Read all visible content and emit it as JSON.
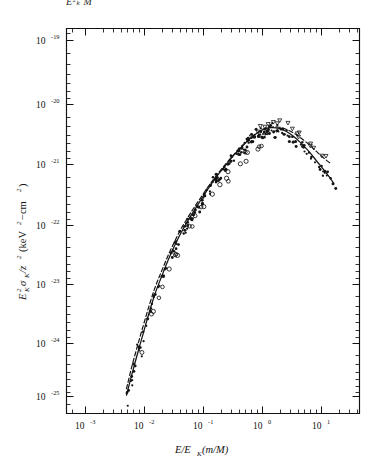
{
  "figure": {
    "clipped_top_text": "E²ₖ M",
    "background_color": "#ffffff",
    "ink_color": "#141414"
  },
  "chart_data": {
    "type": "scatter",
    "title": "",
    "subtitle": "",
    "xlabel": "E/E_K (m/M)",
    "ylabel": "E_K² σ_K/z² (keV² − cm²)",
    "xlabel_parts": {
      "main1": "E/E",
      "sub1": "K",
      "paren": " (m/M)"
    },
    "ylabel_parts": {
      "e": "E",
      "e_sup": "2",
      "e_sub": "K",
      "sigma": "σ",
      "sigma_sub": "K",
      "slash_z": "/z",
      "z_sup": "2",
      "unit": "(keV",
      "unit_sup": "2",
      "unit_tail": "−cm",
      "unit_tail_sup": "2",
      "unit_close": ")"
    },
    "xscale": "log",
    "yscale": "log",
    "xlim": [
      0.0004365,
      31.62
    ],
    "ylim": [
      6.3e-26,
      2e-19
    ],
    "grid": false,
    "legend": "none",
    "x_tick_labels": [
      "10⁻³",
      "10⁻²",
      "10⁻¹",
      "10⁰",
      "10¹"
    ],
    "x_tick_values": [
      0.001,
      0.01,
      0.1,
      1,
      10
    ],
    "x_tick_mantissa": [
      "10",
      "10",
      "10",
      "10",
      "10"
    ],
    "x_tick_exponents": [
      "-3",
      "-2",
      "-1",
      "0",
      "1"
    ],
    "y_tick_labels": [
      "10⁻¹⁹",
      "10⁻²⁰",
      "10⁻²¹",
      "10⁻²²",
      "10⁻²³",
      "10⁻²⁴",
      "10⁻²⁵"
    ],
    "y_tick_values": [
      1e-19,
      1e-20,
      1e-21,
      1e-22,
      1e-23,
      1e-24,
      1e-25
    ],
    "y_tick_mantissa": [
      "10",
      "10",
      "10",
      "10",
      "10",
      "10",
      "10"
    ],
    "y_tick_exponents": [
      "-19",
      "-20",
      "-21",
      "-22",
      "-23",
      "-24",
      "-25"
    ],
    "series": [
      {
        "name": "theory-solid",
        "style": "solid-line",
        "x": [
          0.00495,
          0.006,
          0.0075,
          0.0095,
          0.012,
          0.0152,
          0.0195,
          0.025,
          0.032,
          0.041,
          0.053,
          0.069,
          0.09,
          0.118,
          0.155,
          0.205,
          0.27,
          0.36,
          0.48,
          0.64,
          0.85,
          1.1,
          1.45,
          1.9,
          2.5,
          3.3,
          4.4,
          6.0,
          8.2,
          11.5,
          16.0
        ],
        "y": [
          1.05e-25,
          2.2e-25,
          5e-25,
          1.15e-24,
          2.6e-24,
          5.5e-24,
          1.05e-23,
          1.95e-23,
          3.4e-23,
          5.6e-23,
          8.8e-23,
          1.35e-22,
          2.05e-22,
          3.1e-22,
          4.6e-22,
          6.6e-22,
          9.3e-22,
          1.3e-21,
          1.75e-21,
          2.3e-21,
          2.85e-21,
          3.25e-21,
          3.4e-21,
          3.3e-21,
          2.95e-21,
          2.45e-21,
          1.9e-21,
          1.38e-21,
          9.4e-22,
          6.2e-22,
          4e-22
        ]
      },
      {
        "name": "theory-dashed",
        "style": "dashed-line",
        "x": [
          0.00495,
          0.006,
          0.0075,
          0.0095,
          0.012,
          0.0152,
          0.0195,
          0.025,
          0.032,
          0.041,
          0.053,
          0.069,
          0.09,
          0.118,
          0.155,
          0.205,
          0.27,
          0.36,
          0.48,
          0.64,
          0.85,
          1.1,
          1.45,
          1.9,
          2.5,
          3.3,
          4.4,
          6.0,
          8.2,
          11.5,
          14.5
        ],
        "y": [
          1.35e-25,
          3e-25,
          6.8e-25,
          1.55e-24,
          3.4e-24,
          7e-24,
          1.3e-23,
          2.35e-23,
          4e-23,
          6.5e-23,
          1e-22,
          1.52e-22,
          2.25e-22,
          3.35e-22,
          4.85e-22,
          6.9e-22,
          9.6e-22,
          1.33e-21,
          1.78e-21,
          2.32e-21,
          2.88e-21,
          3.3e-21,
          3.48e-21,
          3.45e-21,
          3.2e-21,
          2.8e-21,
          2.3e-21,
          1.8e-21,
          1.35e-21,
          1e-21,
          8.4e-22
        ]
      },
      {
        "name": "measured-filled-dots",
        "style": "filled-circle",
        "marker": "•",
        "count": 148
      },
      {
        "name": "measured-open-circles",
        "style": "open-circle",
        "marker": "○",
        "count": 26
      },
      {
        "name": "measured-open-triangles",
        "style": "open-triangle",
        "marker": "▽",
        "count": 18
      }
    ]
  }
}
